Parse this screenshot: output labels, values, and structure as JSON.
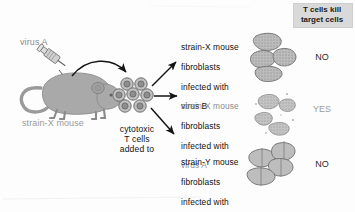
{
  "figure": {
    "source_label": "virus A",
    "mouse_label": "strain-X mouse",
    "tcell_label": "cytotoxic\nT cells\nadded to",
    "header": "T cells kill\ntarget cells",
    "colors": {
      "mouse_fill": "#a9a9a9",
      "mouse_stroke": "#8a8a8a",
      "cell_fill": "#b3b3b3",
      "cell_stroke": "#7c7c7c",
      "tcell_fill": "#bdbdbd",
      "tcell_nucleus": "#6e6e6e",
      "arrow": "#141414",
      "header_bg": "#d9d9d9",
      "text_dark": "#111111",
      "text_grey": "#8c8c8c"
    },
    "targets": [
      {
        "line1": "strain-X mouse",
        "line2": "fibroblasts",
        "line3": "infected with",
        "line4": "virus B",
        "state": "intact",
        "verdict": "NO"
      },
      {
        "line1": "strain-X mouse",
        "line2": "fibroblasts",
        "line3": "infected with",
        "line4": "virus A",
        "state": "lysed",
        "verdict": "YES"
      },
      {
        "line1": "strain-Y mouse",
        "line2": "fibroblasts",
        "line3": "infected with",
        "line4": "virus A",
        "state": "intact-plain",
        "verdict": "NO"
      }
    ]
  }
}
